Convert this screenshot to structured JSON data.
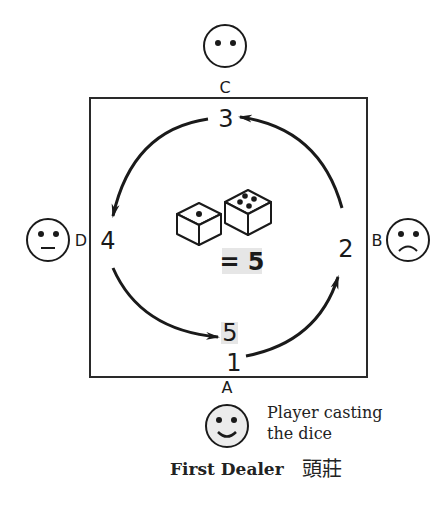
{
  "diagram": {
    "players": {
      "top": {
        "seat": "C",
        "face": "neutral-eyes-only"
      },
      "right": {
        "seat": "B",
        "face": "frown"
      },
      "left": {
        "seat": "D",
        "face": "flat-mouth"
      },
      "bottom": {
        "seat": "A",
        "face": "smile"
      }
    },
    "count_positions": [
      "1",
      "2",
      "3",
      "4",
      "5"
    ],
    "dice": {
      "die1_pips": 1,
      "die2_pips": 4,
      "result_label": "= 5"
    },
    "caption": {
      "line1": "Player casting",
      "line2": "the dice"
    },
    "dealer_label": "First Dealer",
    "dealer_chinese": "頭莊",
    "colors": {
      "ink": "#1a1a1a",
      "highlight": "#e6e6e6",
      "face_fill_bottom": "#ececec"
    }
  }
}
